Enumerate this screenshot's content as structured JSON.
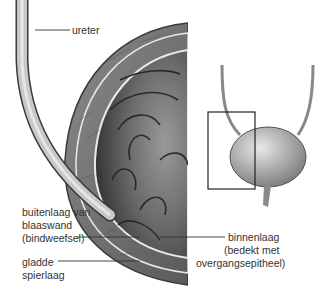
{
  "figure": {
    "labels": {
      "ureter": "ureter",
      "outer_line1": "buitenlaag van",
      "outer_line2": "blaaswand",
      "outer_line3": "(bindweefsel)",
      "smooth_line1": "gladde",
      "smooth_line2": "spierlaag",
      "inner_line1": "binnenlaag",
      "inner_line2": "(bedekt met",
      "inner_line3": "overgangsepitheel)"
    },
    "colors": {
      "wall": "#6e6e6e",
      "lumen": "#4a4a4a",
      "line": "#333333"
    }
  }
}
